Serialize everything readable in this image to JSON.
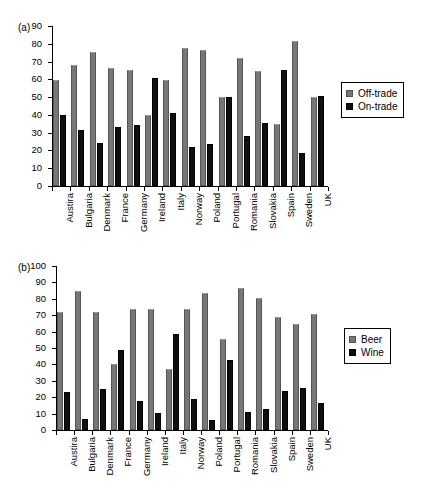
{
  "chart_data": [
    {
      "id": "a",
      "type": "bar",
      "panel_label": "(a)",
      "title": "",
      "xlabel": "",
      "ylabel": "",
      "ylim": [
        0,
        90
      ],
      "ytick_step": 10,
      "yticks": [
        0,
        10,
        20,
        30,
        40,
        50,
        60,
        70,
        80,
        90
      ],
      "grid": false,
      "legend_position": "right",
      "categories": [
        "Austira",
        "Bulgaria",
        "Denmark",
        "France",
        "Germany",
        "Ireland",
        "Italy",
        "Norway",
        "Poland",
        "Portugal",
        "Romania",
        "Slovakia",
        "Spain",
        "Sweden",
        "UK"
      ],
      "series": [
        {
          "name": "Off-trade",
          "color": "#777777",
          "values": [
            59.5,
            68.0,
            75.5,
            66.5,
            65.5,
            40.0,
            59.5,
            77.5,
            76.5,
            50.0,
            72.0,
            64.5,
            35.0,
            81.5,
            50.0
          ]
        },
        {
          "name": "On-trade",
          "color": "#101010",
          "values": [
            40.0,
            31.5,
            24.0,
            33.0,
            34.5,
            60.5,
            41.0,
            22.0,
            23.5,
            50.0,
            28.0,
            35.5,
            65.5,
            18.5,
            50.5
          ]
        }
      ]
    },
    {
      "id": "b",
      "type": "bar",
      "panel_label": "(b)",
      "title": "",
      "xlabel": "",
      "ylabel": "",
      "ylim": [
        0,
        100
      ],
      "ytick_step": 10,
      "yticks": [
        0,
        10,
        20,
        30,
        40,
        50,
        60,
        70,
        80,
        90,
        100
      ],
      "grid": false,
      "legend_position": "right",
      "categories": [
        "Austira",
        "Bulgaria",
        "Denmark",
        "France",
        "Germany",
        "Ireland",
        "Italy",
        "Norway",
        "Poland",
        "Portugal",
        "Romania",
        "Slovakia",
        "Spain",
        "Sweden",
        "UK"
      ],
      "series": [
        {
          "name": "Beer",
          "color": "#777777",
          "values": [
            72.0,
            85.0,
            72.0,
            40.5,
            74.0,
            74.0,
            37.5,
            74.0,
            83.5,
            55.5,
            86.5,
            80.5,
            69.0,
            64.5,
            70.5
          ]
        },
        {
          "name": "Wine",
          "color": "#101010",
          "values": [
            23.0,
            7.0,
            25.0,
            48.5,
            17.5,
            10.5,
            58.5,
            19.0,
            6.0,
            42.5,
            11.0,
            13.0,
            23.5,
            25.5,
            16.5
          ]
        }
      ]
    }
  ]
}
